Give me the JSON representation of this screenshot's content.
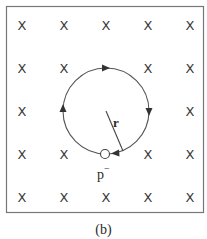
{
  "figure": {
    "caption": "(b)",
    "field_symbol": "X",
    "field_grid": {
      "columns_x": [
        22,
        64,
        106,
        148,
        190
      ],
      "rows_y": [
        25,
        68,
        111,
        154,
        197
      ]
    },
    "hidden_marks": [
      [
        2,
        1
      ],
      [
        1,
        2
      ],
      [
        2,
        2
      ],
      [
        3,
        2
      ],
      [
        2,
        3
      ]
    ],
    "orbit": {
      "cx": 106,
      "cy": 111,
      "r": 43,
      "direction": "clockwise"
    },
    "radius_label": "r",
    "particle_label": "p",
    "particle_charge": "−",
    "colors": {
      "stroke": "#555555",
      "border": "#777777",
      "text": "#2a2a2a"
    }
  }
}
